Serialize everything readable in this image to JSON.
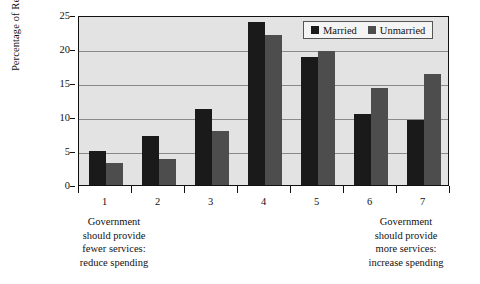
{
  "chart_data": {
    "type": "bar",
    "title": "",
    "subtitle": "",
    "xlabel": "",
    "ylabel": "Percentage of Respondents",
    "categories": [
      "1",
      "2",
      "3",
      "4",
      "5",
      "6",
      "7"
    ],
    "series": [
      {
        "name": "Married",
        "color": "#1a1a1a",
        "values": [
          5.0,
          7.2,
          11.2,
          24.0,
          18.8,
          10.4,
          9.5
        ]
      },
      {
        "name": "Unmarried",
        "color": "#4d4d4d",
        "values": [
          3.3,
          3.8,
          8.0,
          22.0,
          19.7,
          14.3,
          16.3
        ]
      }
    ],
    "ylim": [
      0,
      25
    ],
    "yticks": [
      0,
      5,
      10,
      15,
      20,
      25
    ],
    "ytick_labels": [
      "0",
      "5",
      "10",
      "15",
      "20",
      "25"
    ],
    "gridlines": [
      5,
      10,
      15,
      20
    ],
    "grid": true,
    "legend_position": "top-right",
    "plot_background": "#e3e3e3",
    "annotations": [
      {
        "anchor": "1",
        "text": "Government should provide fewer services: reduce spending",
        "lines": [
          "Government",
          "should provide",
          "fewer services:",
          "reduce spending"
        ]
      },
      {
        "anchor": "7",
        "text": "Government should provide more services: increase spending",
        "lines": [
          "Government",
          "should provide",
          "more services:",
          "increase spending"
        ]
      }
    ]
  },
  "legend": {
    "entries": [
      {
        "label": "Married",
        "color": "#1a1a1a"
      },
      {
        "label": "Unmarried",
        "color": "#4d4d4d"
      }
    ]
  }
}
